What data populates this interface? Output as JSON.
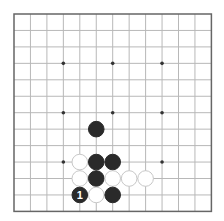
{
  "board": {
    "size": 13,
    "origin": [
      14,
      14
    ],
    "spacing": 16.45,
    "line_color": "#b8b8b8",
    "border_color": "#666666",
    "star_points": [
      [
        3,
        3
      ],
      [
        6,
        3
      ],
      [
        9,
        3
      ],
      [
        3,
        6
      ],
      [
        6,
        6
      ],
      [
        9,
        6
      ],
      [
        3,
        9
      ],
      [
        9,
        9
      ]
    ],
    "stones": [
      {
        "color": "black",
        "col": 5,
        "row": 7
      },
      {
        "color": "white",
        "col": 4,
        "row": 9
      },
      {
        "color": "black",
        "col": 5,
        "row": 9
      },
      {
        "color": "black",
        "col": 6,
        "row": 9
      },
      {
        "color": "white",
        "col": 4,
        "row": 10
      },
      {
        "color": "black",
        "col": 5,
        "row": 10
      },
      {
        "color": "white",
        "col": 6,
        "row": 10
      },
      {
        "color": "white",
        "col": 7,
        "row": 10
      },
      {
        "color": "white",
        "col": 8,
        "row": 10
      },
      {
        "color": "black",
        "col": 4,
        "row": 11,
        "label": "1"
      },
      {
        "color": "white",
        "col": 5,
        "row": 11
      },
      {
        "color": "black",
        "col": 6,
        "row": 11
      }
    ]
  }
}
